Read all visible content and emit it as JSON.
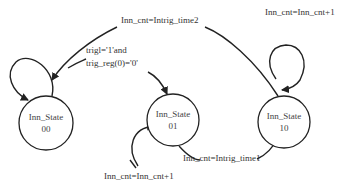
{
  "diagram": {
    "type": "state-machine",
    "states": [
      {
        "id": "s00",
        "name": "Inn_State",
        "code": "00"
      },
      {
        "id": "s01",
        "name": "Inn_State",
        "code": "01"
      },
      {
        "id": "s10",
        "name": "Inn_State",
        "code": "10"
      }
    ],
    "transitions": [
      {
        "from": "s00",
        "to": "s00",
        "label": ""
      },
      {
        "from": "s00",
        "to": "s01",
        "label_line1": "trigl='1'and",
        "label_line2": "trig_reg(0)='0'"
      },
      {
        "from": "s01",
        "to": "s01",
        "label": "Inn_cnt=Inn_cnt+1"
      },
      {
        "from": "s01",
        "to": "s10",
        "label": "Inn_cnt=Intrig_time1"
      },
      {
        "from": "s10",
        "to": "s10",
        "label": "Inn_cnt=Inn_cnt+1"
      },
      {
        "from": "s10",
        "to": "s00",
        "label": "Inn_cnt=Intrig_time2"
      }
    ]
  }
}
